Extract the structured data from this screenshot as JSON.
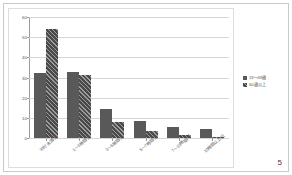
{
  "page": {
    "number": "5"
  },
  "legend": {
    "position": "right",
    "entries": [
      {
        "label": "19〜59歳",
        "color": "#595959",
        "pattern": "solid"
      },
      {
        "label": "60歳以上",
        "color": "#4a4a4a",
        "pattern": "diagonal-hatch"
      }
    ]
  },
  "chart_data": {
    "type": "bar",
    "title": "",
    "subtitle": "",
    "xlabel": "",
    "ylabel": "",
    "ylim": [
      0,
      60
    ],
    "yticks": [
      "0",
      "10",
      "20",
      "30",
      "40",
      "50",
      "60"
    ],
    "grid": true,
    "legend_position": "right",
    "categories": [
      "30分未満/日",
      "1〜3時間/日",
      "3〜5時間/日",
      "5〜7時間/日",
      "7〜10時間/日",
      "10時間以上/日"
    ],
    "series": [
      {
        "name": "19〜59歳",
        "values": [
          32,
          32.5,
          14.5,
          8.5,
          5.3,
          4.3
        ]
      },
      {
        "name": "60歳以上",
        "values": [
          54,
          31,
          7.8,
          3.3,
          1.4,
          0.6
        ]
      }
    ]
  }
}
